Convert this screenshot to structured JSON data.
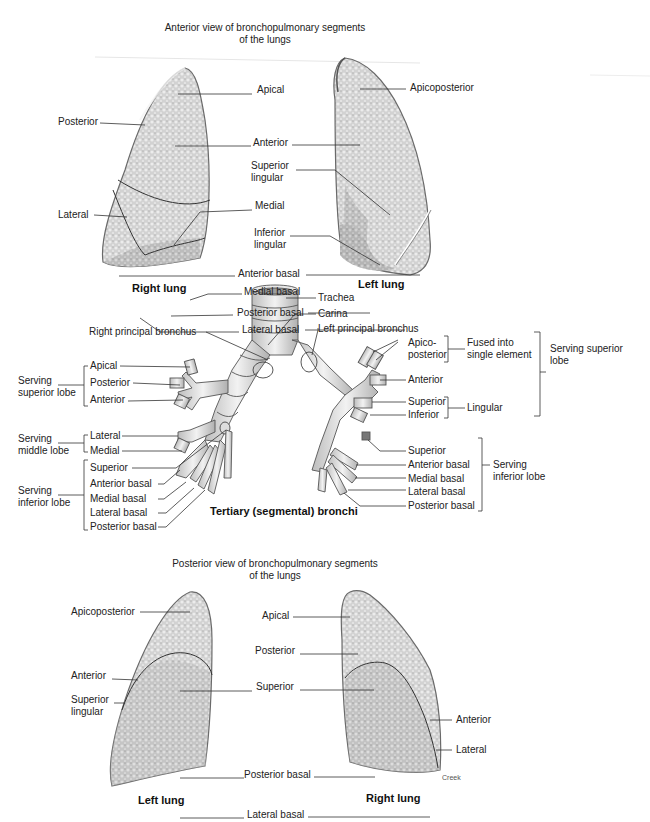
{
  "anterior_view": {
    "title_line1": "Anterior view of bronchopulmonary segments",
    "title_line2": "of the lungs",
    "right_lung": {
      "caption": "Right lung",
      "labels": {
        "apical": "Apical",
        "posterior": "Posterior",
        "anterior": "Anterior",
        "lateral": "Lateral",
        "medial": "Medial",
        "anterior_basal": "Anterior basal",
        "medial_basal": "Medial basal",
        "posterior_basal": "Posterior basal",
        "lateral_basal": "Lateral basal"
      }
    },
    "left_lung": {
      "caption": "Left lung",
      "labels": {
        "apicoposterior": "Apicoposterior",
        "superior_lingular": "Superior lingular",
        "inferior_lingular": "Inferior lingular"
      }
    }
  },
  "bronchi": {
    "caption": "Tertiary (segmental) bronchi",
    "trachea": "Trachea",
    "carina": "Carina",
    "right_principal": "Right principal bronchus",
    "left_principal": "Left principal bronchus",
    "right": {
      "superior_group": "Serving superior lobe",
      "superior": [
        "Apical",
        "Posterior",
        "Anterior"
      ],
      "middle_group": "Serving middle lobe",
      "middle": [
        "Lateral",
        "Medial"
      ],
      "inferior_group": "Serving inferior lobe",
      "inferior": [
        "Superior",
        "Anterior basal",
        "Medial basal",
        "Lateral basal",
        "Posterior basal"
      ]
    },
    "left": {
      "apicoposterior": "Apico-posterior",
      "fused": "Fused into single element",
      "anterior": "Anterior",
      "lingular_superior": "Superior",
      "lingular_inferior": "Inferior",
      "lingular_group": "Lingular",
      "superior_group": "Serving superior lobe",
      "inferior": [
        "Superior",
        "Anterior basal",
        "Medial basal",
        "Lateral basal",
        "Posterior basal"
      ],
      "inferior_group": "Serving inferior lobe"
    }
  },
  "posterior_view": {
    "title_line1": "Posterior view of bronchopulmonary segments",
    "title_line2": "of the lungs",
    "left_lung": {
      "caption": "Left lung",
      "labels": {
        "apicoposterior": "Apicoposterior",
        "anterior": "Anterior",
        "superior_lingular": "Superior lingular"
      }
    },
    "right_lung": {
      "caption": "Right lung",
      "labels": {
        "apical": "Apical",
        "posterior": "Posterior",
        "anterior": "Anterior",
        "lateral": "Lateral"
      }
    },
    "shared_labels": {
      "superior": "Superior",
      "posterior_basal": "Posterior basal",
      "lateral_basal": "Lateral basal"
    },
    "credit": "Creek"
  },
  "colors": {
    "lung_fill": "#d6d6d6",
    "lung_shade": "#a9a9a9",
    "line": "#333333",
    "text": "#222222"
  }
}
